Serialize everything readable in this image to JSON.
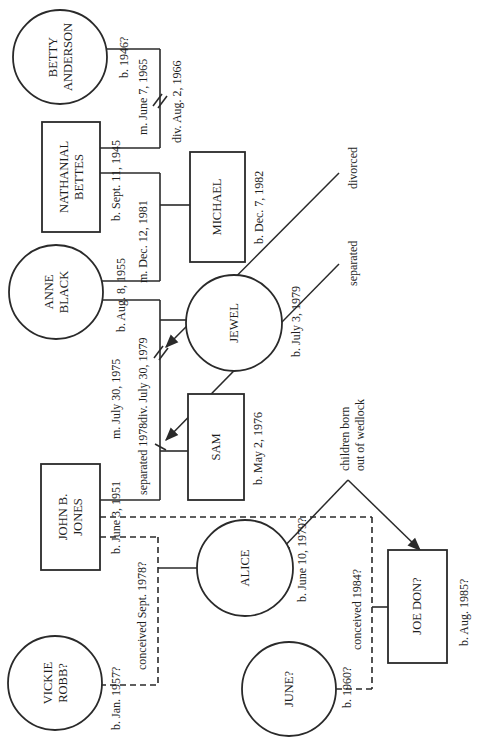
{
  "diagram": {
    "type": "genogram",
    "orientation": "rotated-90-ccw",
    "colors": {
      "ink": "#2a2a2a",
      "background": "#ffffff"
    },
    "people": {
      "betty": {
        "line1": "BETTY",
        "line2": "ANDERSON",
        "sex": "female",
        "birth": "b. 1946?"
      },
      "nathanial": {
        "line1": "NATHANIAL",
        "line2": "BETTES",
        "sex": "male",
        "birth": "b. Sept. 11, 1945"
      },
      "anne": {
        "line1": "ANNE",
        "line2": "BLACK",
        "sex": "female",
        "birth": "b. Aug. 8, 1955"
      },
      "michael": {
        "line1": "MICHAEL",
        "sex": "male",
        "birth": "b. Dec. 7, 1982"
      },
      "jewel": {
        "line1": "JEWEL",
        "sex": "female",
        "birth": "b. July 3, 1979"
      },
      "sam": {
        "line1": "SAM",
        "sex": "male",
        "birth": "b. May 2, 1976"
      },
      "john": {
        "line1": "JOHN B.",
        "line2": "JONES",
        "sex": "male",
        "birth": "b. June 3, 1951"
      },
      "alice": {
        "line1": "ALICE",
        "sex": "female",
        "birth": "b. June 10, 1979?"
      },
      "vickie": {
        "line1": "VICKIE",
        "line2": "ROBB?",
        "sex": "female",
        "birth": "b. Jan. 1957?"
      },
      "june": {
        "line1": "JUNE?",
        "sex": "female",
        "birth": "b. 1960?"
      },
      "joedon": {
        "line1": "JOE DON?",
        "sex": "male",
        "birth": "b. Aug. 1985?"
      }
    },
    "relationships": {
      "betty_nathanial": {
        "married": "m. June 7, 1965",
        "divorced": "div. Aug. 2, 1966"
      },
      "anne_nathanial": {
        "married": "m. Dec. 12, 1981"
      },
      "anne_john": {
        "married": "m. July 30, 1975",
        "divorced": "div. July 30, 1979",
        "separated": "separated 1978"
      },
      "vickie_john": {
        "conceived": "conceived Sept. 1978?"
      },
      "june_john": {
        "conceived": "conceived 1984?"
      }
    },
    "annotations": {
      "divorced": "divorced",
      "separated": "separated",
      "wedlock_line1": "children born",
      "wedlock_line2": "out of wedlock"
    }
  }
}
